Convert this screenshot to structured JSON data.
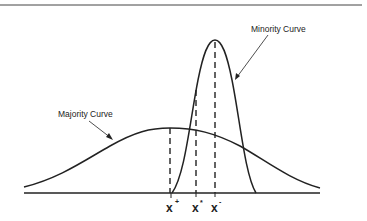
{
  "figure": {
    "labels": {
      "majority_curve": "Majority Curve",
      "minority_curve": "Minority Curve"
    },
    "x_markers": [
      {
        "base": "x",
        "superscript": "+"
      },
      {
        "base": "x",
        "superscript": "*"
      },
      {
        "base": "x",
        "superscript": "-"
      }
    ]
  },
  "colors": {
    "stroke": "#222222",
    "background": "#ffffff"
  }
}
